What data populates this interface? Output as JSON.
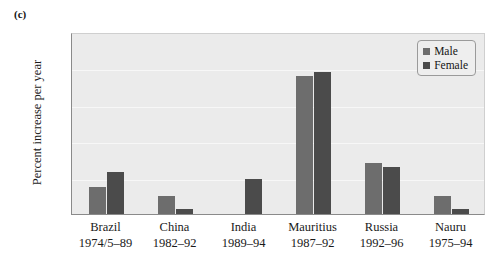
{
  "panel": {
    "label": "(c)"
  },
  "chart_data": {
    "type": "bar",
    "title": "",
    "subtitle": "",
    "xlabel": "",
    "ylabel": "Percent increase per year",
    "ylim": [
      0,
      5
    ],
    "yticks": [
      "0",
      "1",
      "2",
      "3",
      "4",
      "5"
    ],
    "grid": true,
    "legend_position": "top-right-inside",
    "categories": [
      "Brazil",
      "China",
      "India",
      "Mauritius",
      "Russia",
      "Nauru"
    ],
    "category_periods": [
      "1974/5–89",
      "1982–92",
      "1989–94",
      "1987–92",
      "1992–96",
      "1975–94"
    ],
    "series": [
      {
        "name": "Male",
        "color": "#6d6d6d",
        "values": [
          0.75,
          0.5,
          null,
          3.8,
          1.4,
          0.5
        ]
      },
      {
        "name": "Female",
        "color": "#4b4b4b",
        "values": [
          1.15,
          0.15,
          0.95,
          3.9,
          1.3,
          0.15
        ]
      }
    ]
  },
  "legend": {
    "items": [
      {
        "label": "Male"
      },
      {
        "label": "Female"
      }
    ]
  }
}
